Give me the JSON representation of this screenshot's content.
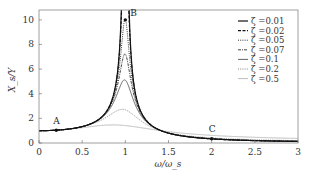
{
  "chart_data": {
    "type": "line",
    "title": "",
    "xlabel": "ω/ω_s",
    "ylabel": "X_s/Y",
    "xlim": [
      0,
      3
    ],
    "ylim": [
      0,
      10.8
    ],
    "xticks": [
      0,
      0.5,
      1,
      1.5,
      2,
      2.5,
      3
    ],
    "xtick_labels": [
      "0",
      "0.5",
      "1",
      "1.5",
      "2",
      "2.5",
      "3"
    ],
    "yticks": [
      0,
      2,
      4,
      6,
      8,
      10
    ],
    "ytick_labels": [
      "0",
      "2",
      "4",
      "6",
      "8",
      "10"
    ],
    "grid": false,
    "legend_position": "upper right",
    "formula": "X_s/Y = sqrt((1+(2ζr)^2)/((1-r^2)^2+(2ζr)^2)), r = ω/ω_s",
    "series": [
      {
        "name": "ζ =0.01",
        "zeta": 0.01,
        "style": "solid",
        "color": "#111111",
        "width": 1.2,
        "peak": 50.0
      },
      {
        "name": "ζ =0.02",
        "zeta": 0.02,
        "style": "dashed",
        "color": "#111111",
        "width": 1.1,
        "peak": 25.0
      },
      {
        "name": "ζ =0.05",
        "zeta": 0.05,
        "style": "dotted",
        "color": "#333333",
        "width": 1.0,
        "peak": 10.0
      },
      {
        "name": "ζ =0.07",
        "zeta": 0.07,
        "style": "dashdot",
        "color": "#444444",
        "width": 1.0,
        "peak": 7.2
      },
      {
        "name": "ζ =0.1",
        "zeta": 0.1,
        "style": "solid",
        "color": "#555555",
        "width": 0.9,
        "peak": 5.1
      },
      {
        "name": "ζ =0.2",
        "zeta": 0.2,
        "style": "dotted",
        "color": "#777777",
        "width": 0.9,
        "peak": 2.7
      },
      {
        "name": "ζ =0.5",
        "zeta": 0.5,
        "style": "solid",
        "color": "#aaaaaa",
        "width": 0.8,
        "peak": 1.5
      }
    ],
    "annotations": [
      {
        "label": "A",
        "x": 0.2,
        "y": 1.04
      },
      {
        "label": "B",
        "x": 1.0,
        "y": 10.0
      },
      {
        "label": "C",
        "x": 2.0,
        "y": 0.34
      }
    ]
  },
  "caption": "ω/ω_s"
}
